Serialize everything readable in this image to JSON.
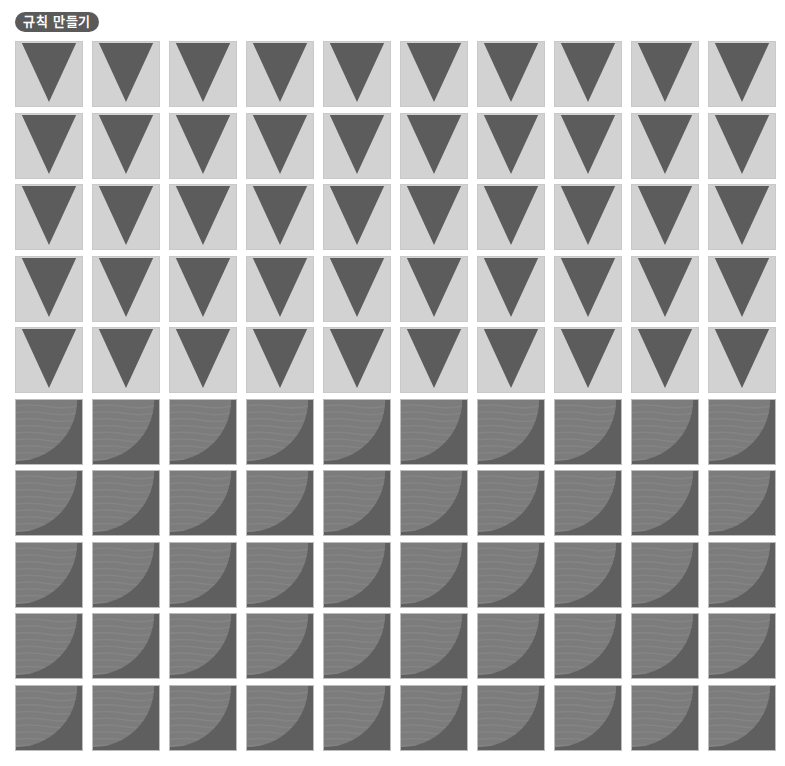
{
  "header": {
    "title": "규칙 만들기"
  },
  "colors": {
    "pill_bg": "#5a5a5a",
    "triangle_tile_bg": "#d2d2d2",
    "triangle_fill": "#5c5c5c",
    "arc_tile_bg": "#5f5f5f",
    "arc_fill": "#7c7c7c"
  },
  "grid": {
    "columns": 10,
    "rows": [
      {
        "pattern": "down-triangle",
        "icon": "down-triangle-icon"
      },
      {
        "pattern": "down-triangle",
        "icon": "down-triangle-icon"
      },
      {
        "pattern": "down-triangle",
        "icon": "down-triangle-icon"
      },
      {
        "pattern": "down-triangle",
        "icon": "down-triangle-icon"
      },
      {
        "pattern": "down-triangle",
        "icon": "down-triangle-icon"
      },
      {
        "pattern": "quarter-circle",
        "icon": "quarter-circle-icon"
      },
      {
        "pattern": "quarter-circle",
        "icon": "quarter-circle-icon"
      },
      {
        "pattern": "quarter-circle",
        "icon": "quarter-circle-icon"
      },
      {
        "pattern": "quarter-circle",
        "icon": "quarter-circle-icon"
      },
      {
        "pattern": "quarter-circle",
        "icon": "quarter-circle-icon"
      }
    ]
  }
}
